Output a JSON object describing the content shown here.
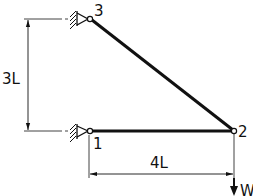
{
  "diagram": {
    "nodes": [
      {
        "id": "1",
        "label": "1",
        "x": 90,
        "y": 131,
        "support": "pin"
      },
      {
        "id": "2",
        "label": "2",
        "x": 234,
        "y": 131,
        "support": "none"
      },
      {
        "id": "3",
        "label": "3",
        "x": 90,
        "y": 18,
        "support": "pin"
      }
    ],
    "members": [
      {
        "from": "1",
        "to": "2"
      },
      {
        "from": "3",
        "to": "2"
      }
    ],
    "dimensions": {
      "vertical": {
        "label": "3L"
      },
      "horizontal": {
        "label": "4L"
      }
    },
    "load": {
      "label": "W",
      "node": "2",
      "direction": "down"
    },
    "colors": {
      "line": "#111111",
      "background": "#ffffff"
    }
  }
}
